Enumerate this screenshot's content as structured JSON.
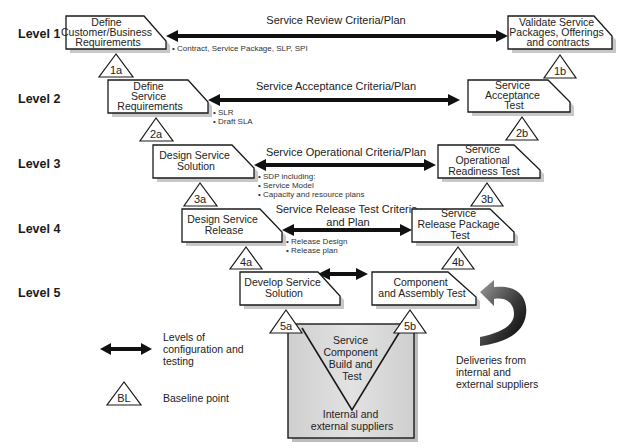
{
  "levels": [
    {
      "label": "Level 1"
    },
    {
      "label": "Level 2"
    },
    {
      "label": "Level 3"
    },
    {
      "label": "Level 4"
    },
    {
      "label": "Level 5"
    }
  ],
  "left_boxes": [
    {
      "lines": [
        "Define",
        "Customer/Business",
        "Requirements"
      ]
    },
    {
      "lines": [
        "Define",
        "Service",
        "Requirements"
      ]
    },
    {
      "lines": [
        "Design Service",
        "Solution"
      ]
    },
    {
      "lines": [
        "Design Service",
        "Release"
      ]
    },
    {
      "lines": [
        "Develop Service",
        "Solution"
      ]
    }
  ],
  "right_boxes": [
    {
      "lines": [
        "Validate Service",
        "Packages, Offerings",
        "and contracts"
      ]
    },
    {
      "lines": [
        "Service",
        "Acceptance",
        "Test"
      ]
    },
    {
      "lines": [
        "Service",
        "Operational",
        "Readiness Test"
      ]
    },
    {
      "lines": [
        "Service",
        "Release Package",
        "Test"
      ]
    },
    {
      "lines": [
        "Component",
        "and Assembly Test"
      ]
    }
  ],
  "criteria": [
    {
      "lines": [
        "Service Review Criteria/Plan"
      ]
    },
    {
      "lines": [
        "Service Acceptance Criteria/Plan"
      ]
    },
    {
      "lines": [
        "Service Operational Criteria/Plan"
      ]
    },
    {
      "lines": [
        "Service Release Test Criteria",
        "and Plan"
      ]
    },
    {
      "lines": []
    }
  ],
  "notes": [
    {
      "lines": [
        "• Contract, Service Package, SLP, SPI"
      ]
    },
    {
      "lines": [
        "• SLR",
        "• Draft SLA"
      ]
    },
    {
      "lines": [
        "• SDP including:",
        "• Service Model",
        "• Capacity and resource plans"
      ]
    },
    {
      "lines": [
        "• Release Design",
        "• Release plan"
      ]
    }
  ],
  "baselines": {
    "b1a": "1a",
    "b1b": "1b",
    "b2a": "2a",
    "b2b": "2b",
    "b3a": "3a",
    "b3b": "3b",
    "b4a": "4a",
    "b4b": "4b",
    "b5a": "5a",
    "b5b": "5b"
  },
  "build_box": {
    "title": [
      "Service",
      "Component",
      "Build and",
      "Test"
    ],
    "footer": [
      "Internal and",
      "external suppliers"
    ]
  },
  "deliveries": {
    "lines": [
      "Deliveries from",
      "internal and",
      "external suppliers"
    ]
  },
  "legend": {
    "arrow_label": [
      "Levels of",
      "configuration and",
      "testing"
    ],
    "baseline_symbol": "BL",
    "baseline_label": "Baseline point"
  },
  "colors": {
    "stroke": "#1a1a1a",
    "shadow": "#c8c8c8",
    "build_box_fill": "#d4d4d4",
    "background": "#ffffff"
  }
}
